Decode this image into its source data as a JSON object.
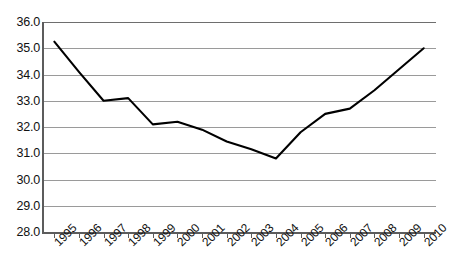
{
  "chart_data": {
    "type": "line",
    "title": "",
    "subtitle": "",
    "xlabel": "",
    "ylabel": "",
    "categories": [
      "1995",
      "1996",
      "1997",
      "1998",
      "1999",
      "2000",
      "2001",
      "2002",
      "2003",
      "2004",
      "2005",
      "2006",
      "2007",
      "2008",
      "2009",
      "2010"
    ],
    "values": [
      35.25,
      34.1,
      33.0,
      33.1,
      32.1,
      32.2,
      31.9,
      31.45,
      31.15,
      30.8,
      31.8,
      32.5,
      32.7,
      33.4,
      34.2,
      35.0
    ],
    "series": [
      {
        "name": "",
        "values": [
          35.25,
          34.1,
          33.0,
          33.1,
          32.1,
          32.2,
          31.9,
          31.45,
          31.15,
          30.8,
          31.8,
          32.5,
          32.7,
          33.4,
          34.2,
          35.0
        ]
      }
    ],
    "ylim": [
      28.0,
      36.0
    ],
    "ytick_labels": [
      "36.0",
      "35.0",
      "34.0",
      "33.0",
      "32.0",
      "31.0",
      "30.0",
      "29.0",
      "28.0"
    ],
    "ytick_values": [
      36.0,
      35.0,
      34.0,
      33.0,
      32.0,
      31.0,
      30.0,
      29.0,
      28.0
    ],
    "xtick_labels": [
      "1995",
      "1996",
      "1997",
      "1998",
      "1999",
      "2000",
      "2001",
      "2002",
      "2003",
      "2004",
      "2005",
      "2006",
      "2007",
      "2008",
      "2009",
      "2010"
    ],
    "grid": true,
    "grid_axis": "y",
    "legend": false,
    "legend_position": "none",
    "annotations": [],
    "line_color": "#000000",
    "grid_color": "#9a9a9a",
    "axis_color": "#5c5c5c",
    "background_color": "#ffffff",
    "markers": false
  }
}
